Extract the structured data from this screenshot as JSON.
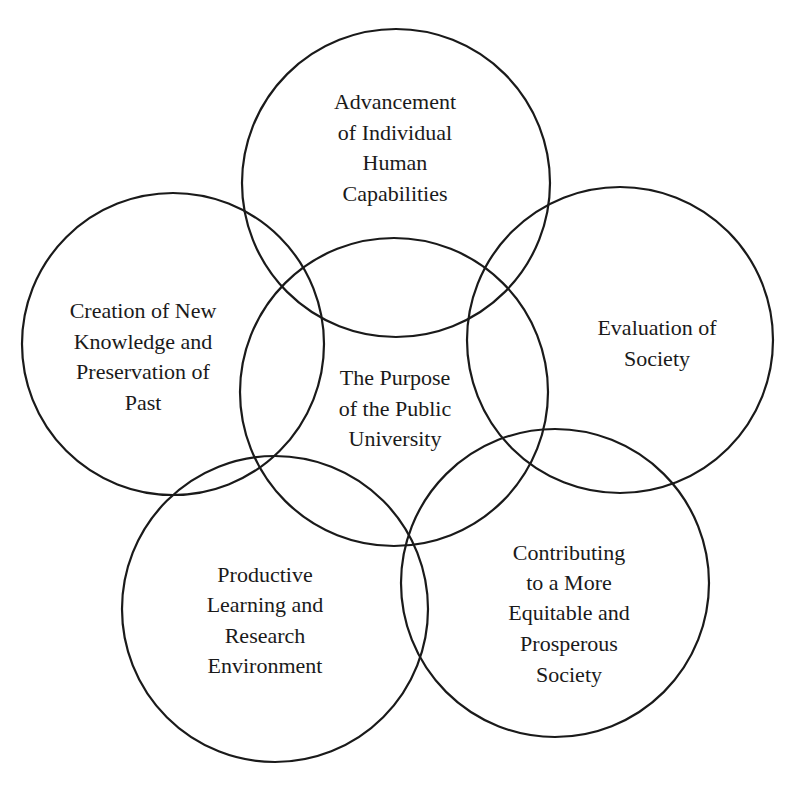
{
  "diagram": {
    "type": "overlapping-circles",
    "stroke_color": "#1a1a1a",
    "background": "#ffffff",
    "center": {
      "lines": [
        "The Purpose",
        "of the Public",
        "University"
      ]
    },
    "nodes": [
      {
        "id": "top",
        "lines": [
          "Advancement",
          "of Individual",
          "Human",
          "Capabilities"
        ]
      },
      {
        "id": "left",
        "lines": [
          "Creation of New",
          "Knowledge and",
          "Preservation of",
          "Past"
        ]
      },
      {
        "id": "right",
        "lines": [
          "Evaluation of",
          "Society"
        ]
      },
      {
        "id": "bottom-left",
        "lines": [
          "Productive",
          "Learning and",
          "Research",
          "Environment"
        ]
      },
      {
        "id": "bottom-right",
        "lines": [
          "Contributing",
          "to a More",
          "Equitable and",
          "Prosperous",
          "Society"
        ]
      }
    ]
  }
}
